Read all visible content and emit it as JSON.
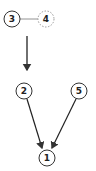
{
  "diagram": {
    "type": "directed-graph",
    "colors": {
      "stroke": "#333333",
      "dashed_stroke": "#888888",
      "background": "#ffffff"
    },
    "nodes": [
      {
        "id": "3",
        "label": "3",
        "x": 12,
        "y": 19,
        "style": "solid"
      },
      {
        "id": "4",
        "label": "4",
        "x": 46,
        "y": 19,
        "style": "dashed"
      },
      {
        "id": "2",
        "label": "2",
        "x": 24,
        "y": 91,
        "style": "solid"
      },
      {
        "id": "5",
        "label": "5",
        "x": 79,
        "y": 91,
        "style": "solid"
      },
      {
        "id": "1",
        "label": "1",
        "x": 47,
        "y": 158,
        "style": "solid"
      }
    ],
    "edges": [
      {
        "from": "3",
        "to": "4",
        "style": "line"
      },
      {
        "from": "3-4",
        "to": "2",
        "style": "arrow"
      },
      {
        "from": "2",
        "to": "1",
        "style": "arrow"
      },
      {
        "from": "5",
        "to": "1",
        "style": "arrow"
      }
    ]
  }
}
